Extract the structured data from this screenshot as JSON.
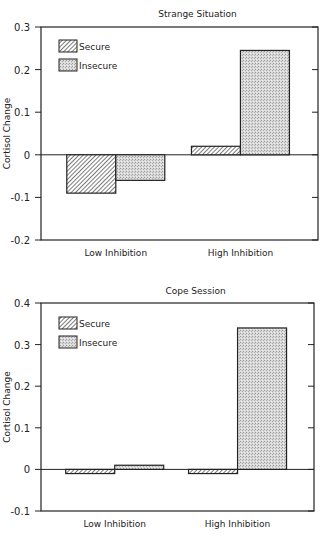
{
  "chart_data": [
    {
      "type": "bar",
      "title": "Strange Situation",
      "xlabel": "",
      "ylabel": "Cortisol Change",
      "categories": [
        "Low Inhibition",
        "High Inhibition"
      ],
      "series": [
        {
          "name": "Secure",
          "pattern": "hatched",
          "values": [
            -0.09,
            0.02
          ]
        },
        {
          "name": "Insecure",
          "pattern": "stippled",
          "values": [
            -0.06,
            0.245
          ]
        }
      ],
      "yticks": [
        0.3,
        0.2,
        0.1,
        0,
        -0.1,
        -0.2
      ],
      "ytick_labels": [
        "0.3",
        "0.2",
        "0.1",
        "0",
        "-0.1",
        "-0.2"
      ],
      "ylim": [
        -0.2,
        0.3
      ],
      "grid": false,
      "legend_position": "upper-left"
    },
    {
      "type": "bar",
      "title": "Cope Session",
      "xlabel": "",
      "ylabel": "Cortisol Change",
      "categories": [
        "Low Inhibition",
        "High Inhibition"
      ],
      "series": [
        {
          "name": "Secure",
          "pattern": "hatched",
          "values": [
            -0.01,
            -0.01
          ]
        },
        {
          "name": "Insecure",
          "pattern": "stippled",
          "values": [
            0.01,
            0.34
          ]
        }
      ],
      "yticks": [
        0.4,
        0.3,
        0.2,
        0.1,
        0,
        -0.1
      ],
      "ytick_labels": [
        "0.4",
        "0.3",
        "0.2",
        "0.1",
        "0",
        "-0.1"
      ],
      "ylim": [
        -0.1,
        0.4
      ],
      "grid": false,
      "legend_position": "upper-left"
    }
  ]
}
